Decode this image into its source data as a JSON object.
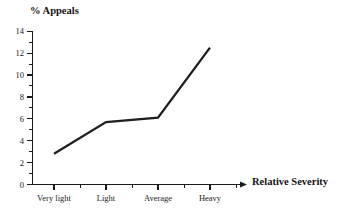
{
  "chart_data": {
    "type": "line",
    "title": "",
    "xlabel": "Relative Severity",
    "ylabel": "% Appeals",
    "categories": [
      "Very light",
      "Light",
      "Average",
      "Heavy"
    ],
    "values": [
      2.8,
      5.7,
      6.1,
      12.5
    ],
    "series": [
      {
        "name": "% Appeals",
        "values": [
          2.8,
          5.7,
          6.1,
          12.5
        ]
      }
    ],
    "ylim": [
      0,
      14
    ],
    "y_ticks": [
      0,
      2,
      4,
      6,
      8,
      10,
      12,
      14
    ],
    "y_tick_labels": [
      "0",
      "2",
      "4",
      "6",
      "8",
      "10",
      "12",
      "14"
    ],
    "y_minor_ticks": [
      1,
      3,
      5,
      7,
      9,
      11,
      13
    ],
    "x_tick_labels": [
      "Very light",
      "Light",
      "Average",
      "Heavy"
    ],
    "grid": false,
    "legend": false,
    "legend_position": "none",
    "line_color": "#1f1f1f",
    "axis_color": "#1a1a1a",
    "background_color": "#ffffff",
    "annotations": []
  },
  "labels": {
    "y_axis_title": "% Appeals",
    "x_axis_title": "Relative Severity",
    "y_0": "0",
    "y_2": "2",
    "y_4": "4",
    "y_6": "6",
    "y_8": "8",
    "y_10": "10",
    "y_12": "12",
    "y_14": "14",
    "x_0": "Very light",
    "x_1": "Light",
    "x_2": "Average",
    "x_3": "Heavy"
  }
}
